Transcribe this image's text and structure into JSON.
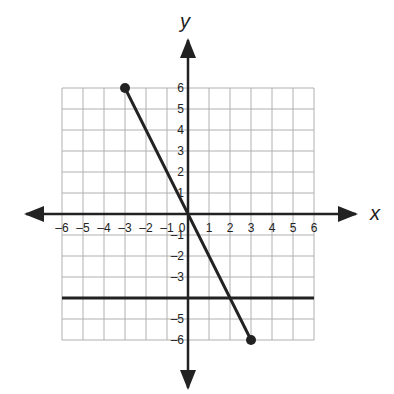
{
  "chart_data": {
    "type": "line",
    "title": "",
    "xlabel": "x",
    "ylabel": "y",
    "xlim": [
      -6,
      6
    ],
    "ylim": [
      -6,
      6
    ],
    "grid": true,
    "grid_step": 1,
    "x_ticks": [
      "-6",
      "-5",
      "-4",
      "-3",
      "-2",
      "-1",
      "0",
      "1",
      "2",
      "3",
      "4",
      "5",
      "6"
    ],
    "y_ticks": [
      "6",
      "5",
      "4",
      "3",
      "2",
      "1",
      "-1",
      "-2",
      "-3",
      "-5",
      "-6"
    ],
    "series": [
      {
        "name": "segment",
        "kind": "line_segment",
        "points": [
          [
            -3,
            6
          ],
          [
            0,
            0
          ],
          [
            3,
            -6
          ]
        ],
        "endpoints_marked": true,
        "equation": "y = -2x"
      },
      {
        "name": "horizontal line",
        "kind": "line",
        "points": [
          [
            -6,
            -4
          ],
          [
            6,
            -4
          ]
        ],
        "equation": "y = -4"
      }
    ],
    "colors": {
      "grid": "#b0b0b0",
      "axes": "#222222",
      "lines": "#222222"
    }
  }
}
